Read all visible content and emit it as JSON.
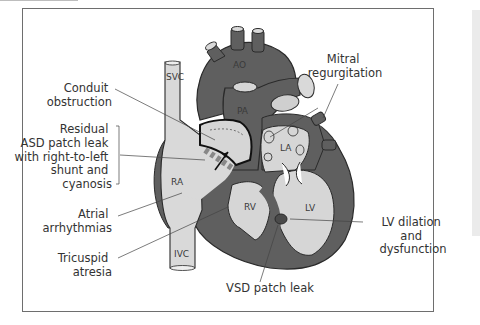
{
  "figure": {
    "colors": {
      "dark_tissue": "#5f5f5f",
      "light_chamber": "#d6d6d6",
      "vessel_fill": "#d9d9d9",
      "outline": "#2a2a2a",
      "label_text": "#333333",
      "frame": "#6e6e6e",
      "side_panel": "#ebebeb"
    }
  },
  "structures": {
    "svc": "SVC",
    "ivc": "IVC",
    "ao": "AO",
    "pa": "PA",
    "la": "LA",
    "ra": "RA",
    "rv": "RV",
    "lv": "LV"
  },
  "labels": {
    "conduit_obstruction": [
      "Conduit",
      "obstruction"
    ],
    "residual_asd": [
      "Residual",
      "ASD patch leak",
      "with right-to-left",
      "shunt and",
      "cyanosis"
    ],
    "atrial_arrhythmias": [
      "Atrial",
      "arrhythmias"
    ],
    "tricuspid_atresia": [
      "Tricuspid",
      "atresia"
    ],
    "mitral_regurgitation": [
      "Mitral",
      "regurgitation"
    ],
    "lv_dilation": [
      "LV dilation",
      "and",
      "dysfunction"
    ],
    "vsd_patch_leak": [
      "VSD patch leak"
    ]
  }
}
